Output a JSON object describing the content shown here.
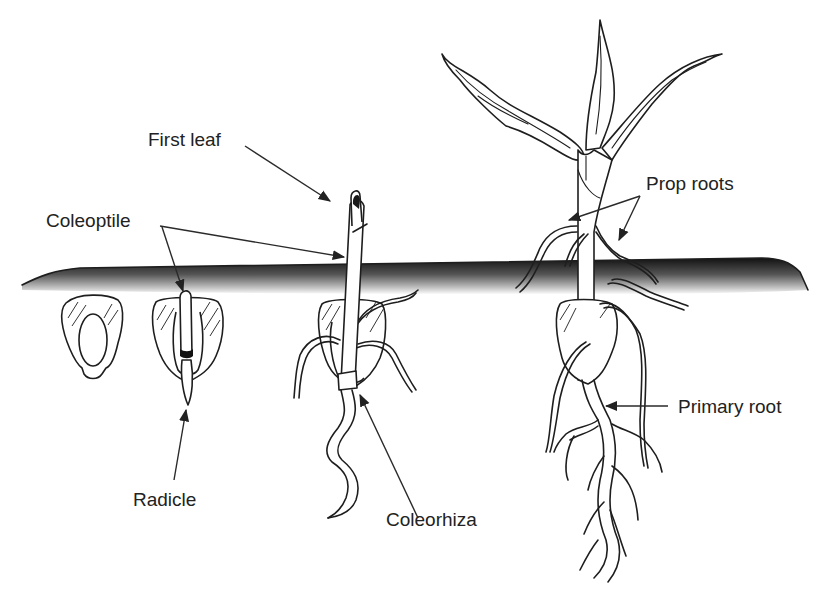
{
  "diagram": {
    "title": "",
    "colors": {
      "background": "#ffffff",
      "line": "#1e1e1e",
      "soil_dark": "#141414",
      "label_text": "#222222"
    },
    "labels": {
      "first_leaf": "First leaf",
      "coleoptile": "Coleoptile",
      "prop_roots": "Prop roots",
      "radicle": "Radicle",
      "coleorhiza": "Coleorhiza",
      "primary_root": "Primary root"
    },
    "stages": [
      {
        "id": "stage-1",
        "description": "Ungerminated kernel"
      },
      {
        "id": "stage-2",
        "description": "Kernel with emerging coleoptile and radicle"
      },
      {
        "id": "stage-3",
        "description": "Seedling with first leaf emerging from coleoptile, seminal roots and coleorhiza"
      },
      {
        "id": "stage-4",
        "description": "Young plant with leaves, prop roots and branched primary root system"
      }
    ]
  }
}
